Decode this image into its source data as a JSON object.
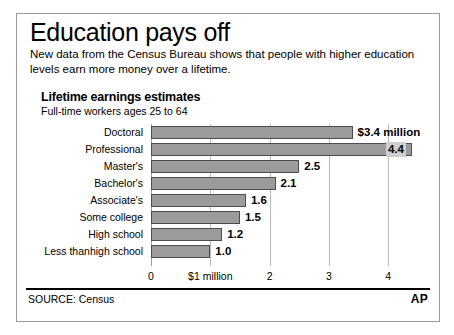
{
  "headline": "Education pays off",
  "deck": "New data from the Census Bureau shows that people with higher education levels earn more money over a lifetime.",
  "chart_title": "Lifetime earnings estimates",
  "chart_subtitle": "Full-time workers ages 25 to 64",
  "source": "SOURCE: Census",
  "logo": "AP",
  "colors": {
    "bar_fill": "#9b9b9b",
    "bar_stroke": "#4d4d4d",
    "gridline": "#b9b9b9",
    "frame": "#9a9a9a",
    "text": "#000000",
    "value_chip": "#cfcfcf"
  },
  "chart_data": {
    "type": "bar",
    "orientation": "horizontal",
    "title": "Lifetime earnings estimates",
    "subtitle": "Full-time workers ages 25 to 64",
    "xlabel": "",
    "ylabel": "",
    "xlim": [
      0,
      4.6
    ],
    "grid": true,
    "legend": false,
    "unit": "millions of dollars",
    "tick_values": [
      0,
      1,
      2,
      3,
      4
    ],
    "tick_labels": [
      "0",
      "$1 million",
      "2",
      "3",
      "4"
    ],
    "categories": [
      "Doctoral",
      "Professional",
      "Master's",
      "Bachelor's",
      "Associate's",
      "Some college",
      "High school",
      "Less thanhigh school"
    ],
    "values": [
      3.4,
      4.4,
      2.5,
      2.1,
      1.6,
      1.5,
      1.2,
      1.0
    ],
    "value_labels": [
      "$3.4 million",
      "4.4",
      "2.5",
      "2.1",
      "1.6",
      "1.5",
      "1.2",
      "1.0"
    ],
    "label_placement": [
      "outside",
      "inside",
      "outside",
      "outside",
      "outside",
      "outside",
      "outside",
      "outside"
    ]
  }
}
